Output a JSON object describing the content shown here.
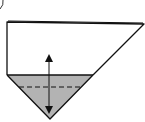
{
  "diagram": {
    "type": "origami-fold-step",
    "colors": {
      "background": "#ffffff",
      "line": "#111111",
      "shaded_layer": "#b3b3b3"
    },
    "elements": {
      "paper_outline": "pentagon-shape paper",
      "shaded_region": "triangular colored back side",
      "fold_line": "dashed valley fold",
      "arrow": "double-headed fold/unfold arrow"
    }
  }
}
